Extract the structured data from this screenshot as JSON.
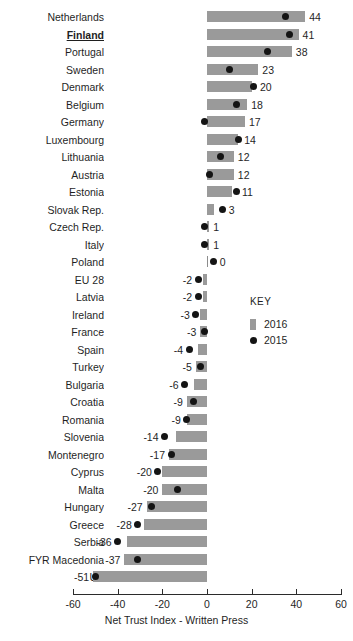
{
  "title_fragment": "",
  "axis": {
    "title": "Net Trust Index - Written Press",
    "ticks": [
      "-60",
      "-40",
      "-20",
      "0",
      "20",
      "40",
      "60"
    ],
    "min": -60,
    "max": 60
  },
  "legend": {
    "title": "KEY",
    "items": [
      {
        "label": "2016",
        "marker": "bar-swatch",
        "color": "#9a9a9a"
      },
      {
        "label": "2015",
        "marker": "dot",
        "color": "#141414"
      }
    ]
  },
  "chart_data": {
    "type": "bar",
    "title": "",
    "xlabel": "Net Trust Index - Written Press",
    "ylabel": "",
    "xlim": [
      -60,
      60
    ],
    "grid": false,
    "legend_position": "middle-right",
    "orientation": "horizontal",
    "highlight_category": "Finland",
    "categories": [
      "Netherlands",
      "Finland",
      "Portugal",
      "Sweden",
      "Denmark",
      "Belgium",
      "Germany",
      "Luxembourg",
      "Lithuania",
      "Austria",
      "Estonia",
      "Slovak Rep.",
      "Czech Rep.",
      "Italy",
      "Poland",
      "EU 28",
      "Latvia",
      "Ireland",
      "France",
      "Spain",
      "Turkey",
      "Bulgaria",
      "Croatia",
      "Romania",
      "Slovenia",
      "Montenegro",
      "Cyprus",
      "Malta",
      "Hungary",
      "Greece",
      "Serbia",
      "FYR Macedonia",
      "UK"
    ],
    "series": [
      {
        "name": "2016",
        "type": "bar",
        "color": "#9a9a9a",
        "values": [
          44,
          41,
          38,
          23,
          20,
          18,
          17,
          14,
          12,
          12,
          11,
          3,
          1,
          1,
          0,
          -2,
          -2,
          -3,
          -3,
          -4,
          -5,
          -6,
          -9,
          -9,
          -14,
          -17,
          -20,
          -20,
          -27,
          -28,
          -36,
          -37,
          -51
        ]
      },
      {
        "name": "2015",
        "type": "scatter",
        "color": "#141414",
        "values": [
          35,
          37,
          27,
          10,
          21,
          13,
          -1,
          14,
          6,
          1,
          13,
          7,
          -1,
          -1,
          3,
          -4,
          -4,
          -5,
          -1,
          -8,
          -3,
          -10,
          -6,
          -9,
          -19,
          -16,
          -22,
          -13,
          -25,
          -31,
          -40,
          -31,
          -50
        ]
      }
    ],
    "data_labels": [
      "44",
      "41",
      "38",
      "23",
      "20",
      "18",
      "17",
      "14",
      "12",
      "12",
      "11",
      "3",
      "1",
      "1",
      "0",
      "-2",
      "-2",
      "-3",
      "-3",
      "-4",
      "-5",
      "-6",
      "-9",
      "-9",
      "-14",
      "-17",
      "-20",
      "-20",
      "-27",
      "-28",
      "-36",
      "-37",
      "-51"
    ]
  }
}
